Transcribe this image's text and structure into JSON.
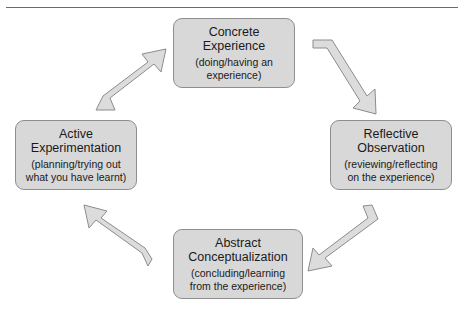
{
  "header": {
    "cut_off_text": "",
    "divider": "horizontal-rule"
  },
  "diagram": {
    "name": "Kolb experiential learning cycle",
    "direction": "clockwise",
    "box_fill": "#d8d8d8",
    "box_border": "#8e8e8e",
    "arrow_fill": "#dcdcdc",
    "arrow_border": "#8c8c8c",
    "nodes": [
      {
        "id": "concrete",
        "title": "Concrete\nExperience",
        "subtitle": "(doing/having an\nexperience)",
        "position": "top"
      },
      {
        "id": "reflective",
        "title": "Reflective\nObservation",
        "subtitle": "(reviewing/reflecting\non the experience)",
        "position": "right"
      },
      {
        "id": "abstract",
        "title": "Abstract\nConceptualization",
        "subtitle": "(concluding/learning\nfrom the experience)",
        "position": "bottom"
      },
      {
        "id": "active",
        "title": "Active\nExperimentation",
        "subtitle": "(planning/trying out\nwhat you have learnt)",
        "position": "left"
      }
    ],
    "arrows": [
      {
        "id": "concrete-to-reflective",
        "from": "concrete",
        "to": "reflective",
        "points": "down-right"
      },
      {
        "id": "reflective-to-abstract",
        "from": "reflective",
        "to": "abstract",
        "points": "down-left"
      },
      {
        "id": "abstract-to-active",
        "from": "abstract",
        "to": "active",
        "points": "up-left"
      },
      {
        "id": "active-to-concrete",
        "from": "active",
        "to": "concrete",
        "points": "up-right"
      }
    ]
  }
}
